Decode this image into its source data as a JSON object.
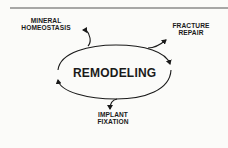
{
  "diagram": {
    "center_label": "REMODELING",
    "nodes": [
      {
        "id": "mineral",
        "lines": [
          "MINERAL",
          "HOMEOSTASIS"
        ]
      },
      {
        "id": "fracture",
        "lines": [
          "FRACTURE",
          "REPAIR"
        ]
      },
      {
        "id": "implant",
        "lines": [
          "IMPLANT",
          "FIXATION"
        ]
      }
    ],
    "edges": [
      {
        "from": "REMODELING",
        "to": "MINERAL HOMEOSTASIS"
      },
      {
        "from": "REMODELING",
        "to": "FRACTURE REPAIR"
      },
      {
        "from": "REMODELING",
        "to": "IMPLANT FIXATION"
      }
    ],
    "colors": {
      "ink": "#1a1a1a",
      "rule": "#555555",
      "background": "#fbfbf9"
    }
  }
}
